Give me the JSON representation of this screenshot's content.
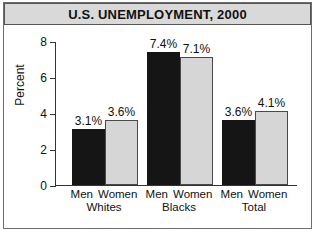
{
  "title": "U.S. UNEMPLOYMENT, 2000",
  "chart_data": {
    "type": "bar",
    "title": "U.S. UNEMPLOYMENT, 2000",
    "xlabel": "",
    "ylabel": "Percent",
    "ylim": [
      0,
      8
    ],
    "yticks": [
      "0",
      "2",
      "4",
      "6",
      "8"
    ],
    "grid": false,
    "legend": "none",
    "categories": [
      "Whites",
      "Blacks",
      "Total"
    ],
    "subcategories": [
      "Men",
      "Women"
    ],
    "series": [
      {
        "name": "Men",
        "values": [
          3.1,
          3.6,
          3.6
        ],
        "color": "#151515"
      },
      {
        "name": "Women",
        "values": [
          3.6,
          7.1,
          4.1
        ],
        "color": "#d6d6d6"
      }
    ],
    "bars": [
      {
        "group": "Whites",
        "sub": "Men",
        "value": 3.1,
        "label": "3.1%",
        "style": "dark"
      },
      {
        "group": "Whites",
        "sub": "Women",
        "value": 3.6,
        "label": "3.6%",
        "style": "light"
      },
      {
        "group": "Blacks",
        "sub": "Men",
        "value": 7.4,
        "label": "7.4%",
        "style": "dark"
      },
      {
        "group": "Blacks",
        "sub": "Women",
        "value": 7.1,
        "label": "7.1%",
        "style": "light"
      },
      {
        "group": "Total",
        "sub": "Men",
        "value": 3.6,
        "label": "3.6%",
        "style": "dark"
      },
      {
        "group": "Total",
        "sub": "Women",
        "value": 4.1,
        "label": "4.1%",
        "style": "light"
      }
    ]
  },
  "colors": {
    "bar_dark": "#151515",
    "bar_light": "#d6d6d6",
    "title_bar": "#d9d9d9",
    "frame": "#6d6d6d",
    "axis": "#333333"
  }
}
